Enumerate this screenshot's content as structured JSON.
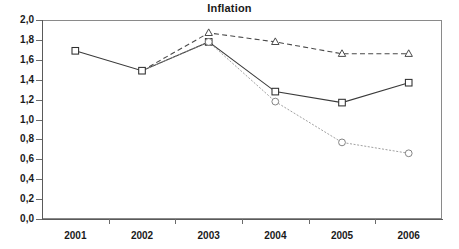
{
  "chart_data": {
    "type": "line",
    "title": "Inflation",
    "xlabel": "",
    "ylabel": "",
    "x": [
      "2001",
      "2002",
      "2003",
      "2004",
      "2005",
      "2006"
    ],
    "categories": [
      "2001",
      "2002",
      "2003",
      "2004",
      "2005",
      "2006"
    ],
    "ylim": [
      0.0,
      2.0
    ],
    "ytick_labels": [
      "0,0",
      "0,2",
      "0,4",
      "0,6",
      "0,8",
      "1,0",
      "1,2",
      "1,4",
      "1,6",
      "1,8",
      "2,0"
    ],
    "ytick_values": [
      0.0,
      0.2,
      0.4,
      0.6,
      0.8,
      1.0,
      1.2,
      1.4,
      1.6,
      1.8,
      2.0
    ],
    "xtick_labels": [
      "2001",
      "2002",
      "2003",
      "2004",
      "2005",
      "2006"
    ],
    "grid": false,
    "legend": "none",
    "decimal_separator": ",",
    "series": [
      {
        "name": "solid-square-series",
        "marker": "square",
        "linestyle": "solid",
        "color": "#3a3a3a",
        "x": [
          "2001",
          "2002",
          "2003",
          "2004",
          "2005",
          "2006"
        ],
        "values": [
          1.69,
          1.49,
          1.78,
          1.28,
          1.17,
          1.37
        ]
      },
      {
        "name": "dashed-triangle-series",
        "marker": "triangle",
        "linestyle": "dashed",
        "color": "#4a4a4a",
        "x": [
          "2002",
          "2003",
          "2004",
          "2005",
          "2006"
        ],
        "values": [
          1.49,
          1.87,
          1.78,
          1.66,
          1.66
        ]
      },
      {
        "name": "dotted-circle-series",
        "marker": "circle",
        "linestyle": "dotted",
        "color": "#8f8f8f",
        "x": [
          "2002",
          "2003",
          "2004",
          "2005",
          "2006"
        ],
        "values": [
          1.49,
          1.78,
          1.18,
          0.77,
          0.66
        ]
      }
    ]
  },
  "axes": {
    "y_labels": [
      "2,0",
      "1,8",
      "1,6",
      "1,4",
      "1,2",
      "1,0",
      "0,8",
      "0,6",
      "0,4",
      "0,2",
      "0,0"
    ],
    "x_labels": [
      "2001",
      "2002",
      "2003",
      "2004",
      "2005",
      "2006"
    ]
  },
  "header": {
    "title": "Inflation"
  }
}
